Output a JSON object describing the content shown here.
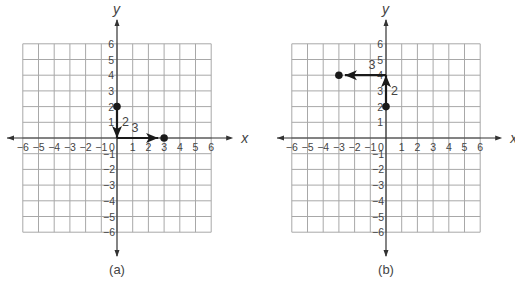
{
  "figure": {
    "panels": [
      {
        "caption": "(a)",
        "axis_labels": {
          "x": "x",
          "y": "y"
        },
        "start_point": {
          "x": 0,
          "y": 2,
          "label": "(0, 2)"
        },
        "end_point": {
          "x": 3,
          "y": 0,
          "label": "(3, 0)"
        },
        "moves": [
          {
            "direction": "down",
            "length": 2,
            "label": "2"
          },
          {
            "direction": "right",
            "length": 3,
            "label": "3"
          }
        ]
      },
      {
        "caption": "(b)",
        "axis_labels": {
          "x": "x",
          "y": "y"
        },
        "start_point": {
          "x": 0,
          "y": 2,
          "label": "(0, 2)"
        },
        "end_point": {
          "x": -3,
          "y": 4,
          "label": "(-3, 4)"
        },
        "moves": [
          {
            "direction": "up",
            "length": 2,
            "label": "2"
          },
          {
            "direction": "left",
            "length": 3,
            "label": "3"
          }
        ]
      }
    ],
    "ticks": {
      "x": [
        "−6",
        "−5",
        "−4",
        "−3",
        "−2",
        "−1",
        "0",
        "1",
        "2",
        "3",
        "4",
        "5",
        "6"
      ],
      "y_pos": [
        "1",
        "2",
        "3",
        "4",
        "5",
        "6"
      ],
      "y_neg": [
        "−1",
        "−2",
        "−3",
        "−4",
        "−5",
        "−6"
      ]
    },
    "colors": {
      "grid": "#a8a8a8",
      "axis": "#333333",
      "vector": "#1a1a1a",
      "text": "#444444"
    }
  },
  "chart_data": [
    {
      "type": "scatter",
      "title": "(a)",
      "xlabel": "x",
      "ylabel": "y",
      "xlim": [
        -6,
        6
      ],
      "ylim": [
        -6,
        6
      ],
      "grid": true,
      "points": [
        {
          "x": 0,
          "y": 2
        },
        {
          "x": 3,
          "y": 0
        }
      ],
      "annotations": [
        {
          "type": "arrow",
          "from": [
            0,
            2
          ],
          "to": [
            0,
            0
          ],
          "label": "2"
        },
        {
          "type": "arrow",
          "from": [
            0,
            0
          ],
          "to": [
            3,
            0
          ],
          "label": "3"
        }
      ]
    },
    {
      "type": "scatter",
      "title": "(b)",
      "xlabel": "x",
      "ylabel": "y",
      "xlim": [
        -6,
        6
      ],
      "ylim": [
        -6,
        6
      ],
      "grid": true,
      "points": [
        {
          "x": 0,
          "y": 2
        },
        {
          "x": -3,
          "y": 4
        }
      ],
      "annotations": [
        {
          "type": "arrow",
          "from": [
            0,
            2
          ],
          "to": [
            0,
            4
          ],
          "label": "2"
        },
        {
          "type": "arrow",
          "from": [
            0,
            4
          ],
          "to": [
            -3,
            4
          ],
          "label": "3"
        }
      ]
    }
  ]
}
